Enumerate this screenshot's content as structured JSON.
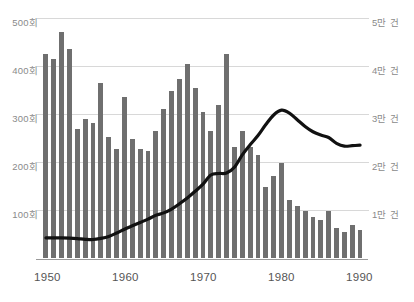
{
  "chart_data": {
    "type": "bar",
    "title": "",
    "subtitle": "",
    "xlabel": "",
    "ylabel": "",
    "y_left_axis": {
      "label_unit": "회",
      "ticks": [
        100,
        200,
        300,
        400,
        500
      ],
      "tick_labels": [
        "100회",
        "200회",
        "300회",
        "400회",
        "500회"
      ],
      "ylim": [
        0,
        500
      ]
    },
    "y_right_axis": {
      "label_unit": "만 건",
      "ticks": [
        10000,
        20000,
        30000,
        40000,
        50000
      ],
      "tick_labels": [
        "1만 건",
        "2만 건",
        "3만 건",
        "4만 건",
        "5만 건"
      ],
      "ylim": [
        0,
        50000
      ]
    },
    "x": [
      1950,
      1951,
      1952,
      1953,
      1954,
      1955,
      1956,
      1957,
      1958,
      1959,
      1960,
      1961,
      1962,
      1963,
      1964,
      1965,
      1966,
      1967,
      1968,
      1969,
      1970,
      1971,
      1972,
      1973,
      1974,
      1975,
      1976,
      1977,
      1978,
      1979,
      1980,
      1981,
      1982,
      1983,
      1984,
      1985,
      1986,
      1987,
      1988,
      1989,
      1990
    ],
    "x_tick_labels": [
      "1950",
      "1960",
      "1970",
      "1980",
      "1990"
    ],
    "x_ticks": [
      1950,
      1960,
      1970,
      1980,
      1990
    ],
    "xlim": [
      1949.5,
      1990.5
    ],
    "grid": true,
    "legend": "none",
    "series": [
      {
        "name": "연간 횟수",
        "type": "bar",
        "axis": "left",
        "unit": "회",
        "color": "#6f6f6f",
        "values": [
          425,
          415,
          470,
          435,
          268,
          290,
          282,
          365,
          252,
          228,
          335,
          248,
          228,
          222,
          265,
          310,
          348,
          372,
          405,
          355,
          305,
          265,
          318,
          425,
          232,
          265,
          232,
          215,
          148,
          170,
          198,
          120,
          108,
          97,
          85,
          80,
          98,
          62,
          55,
          68,
          58
        ]
      },
      {
        "name": "건수",
        "type": "line",
        "axis": "right",
        "unit": "건",
        "color": "#111111",
        "values": [
          4200,
          4200,
          4200,
          4150,
          4050,
          3900,
          3850,
          4100,
          4500,
          5200,
          6000,
          6700,
          7400,
          8100,
          8900,
          9400,
          10200,
          11300,
          12500,
          13900,
          15400,
          17300,
          17600,
          17700,
          18900,
          21500,
          23600,
          25500,
          27800,
          29800,
          30800,
          30200,
          28800,
          27400,
          26300,
          25600,
          25100,
          23900,
          23300,
          23400,
          23500
        ]
      }
    ]
  }
}
